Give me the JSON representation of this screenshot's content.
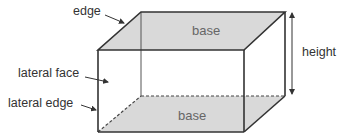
{
  "diagram": {
    "labels": {
      "edge": "edge",
      "top_base": "base",
      "bottom_base": "base",
      "height": "height",
      "lateral_face": "lateral face",
      "lateral_edge": "lateral edge"
    },
    "colors": {
      "fill": "#d9d9d9",
      "stroke": "#333333",
      "text": "#333333",
      "base_text": "#666666"
    }
  }
}
